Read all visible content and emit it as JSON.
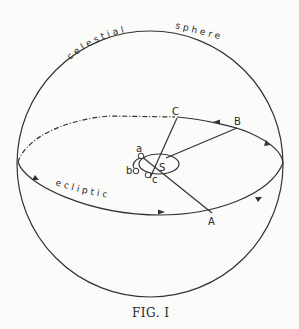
{
  "figure": {
    "caption": "FIG. I",
    "labels": {
      "celestial": "celestial",
      "sphere": "sphere",
      "ecliptic": "ecliptic",
      "A": "A",
      "B": "B",
      "C": "C",
      "S": "S",
      "a": "a",
      "b": "b",
      "c": "c"
    }
  },
  "colors": {
    "ink": "#333333",
    "paper": "#fbfbf9"
  }
}
